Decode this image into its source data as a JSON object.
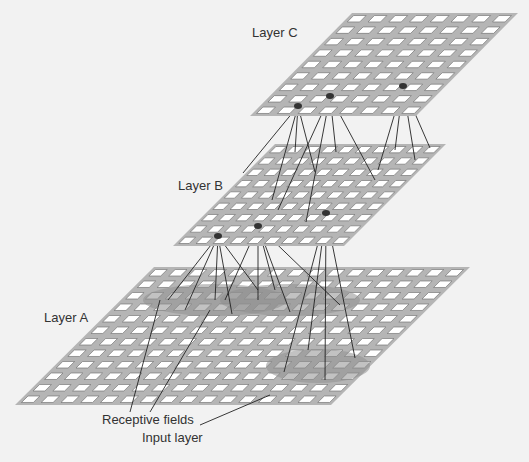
{
  "diagram": {
    "labels": {
      "layer_c": "Layer C",
      "layer_b": "Layer B",
      "layer_a": "Layer A",
      "receptive_fields": "Receptive fields",
      "input_layer": "Input layer"
    },
    "layers": [
      {
        "name": "Layer C",
        "rows": 9,
        "cols": 8
      },
      {
        "name": "Layer B",
        "rows": 9,
        "cols": 10
      },
      {
        "name": "Layer A",
        "rows": 12,
        "cols": 16
      }
    ],
    "colors": {
      "background": "#f2f2f2",
      "plane": "#b5b5b5",
      "cell": "#ffffff",
      "field": "#8f8f8f",
      "line": "#222222"
    }
  }
}
